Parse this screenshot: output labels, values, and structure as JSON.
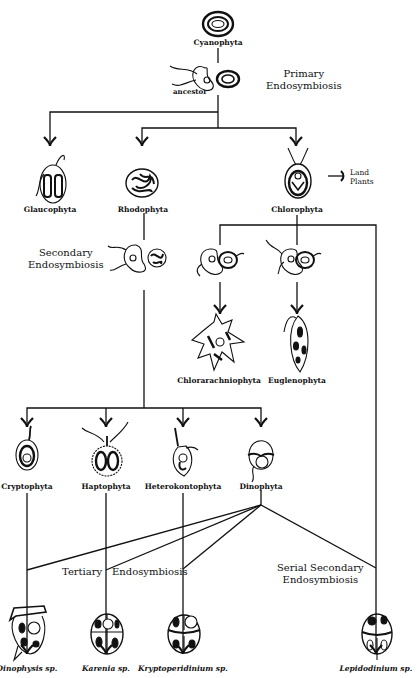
{
  "diagram": {
    "type": "phylogenetic-tree",
    "topic": "Endosymbiotic origins of plastids"
  },
  "nodes": {
    "cyanophyta": "Cyanophyta",
    "ancestor": "ancestor",
    "glaucophyta": "Glaucophyta",
    "rhodophyta": "Rhodophyta",
    "chlorophyta": "Chlorophyta",
    "land_plants": "Land Plants",
    "chlorarachniophyta": "Chlorarachniophyta",
    "euglenophyta": "Euglenophyta",
    "cryptophyta": "Cryptophyta",
    "haptophyta": "Haptophyta",
    "heterokontophyta": "Heterokontophyta",
    "dinophyta": "Dinophyta",
    "dinophysis": "Dinophysis sp.",
    "karenia": "Karenia sp.",
    "kryptoperidinium": "Kryptoperidinium sp.",
    "lepidodinium": "Lepidodinium sp."
  },
  "events": {
    "primary_1": "Primary",
    "primary_2": "Endosymbiosis",
    "secondary_1": "Secondary",
    "secondary_2": "Endosymbiosis",
    "tertiary_1": "Tertiary",
    "tertiary_2": "Endosymbiosis",
    "serial_1": "Serial Secondary",
    "serial_2": "Endosymbiosis"
  },
  "land_plants": {
    "line1": "Land",
    "line2": "Plants"
  },
  "edges": [
    [
      "Cyanophyta",
      "ancestor"
    ],
    [
      "ancestor",
      "Glaucophyta"
    ],
    [
      "ancestor",
      "Rhodophyta"
    ],
    [
      "ancestor",
      "Chlorophyta"
    ],
    [
      "Chlorophyta",
      "Land Plants"
    ],
    [
      "Chlorophyta",
      "Chlorarachniophyta"
    ],
    [
      "Chlorophyta",
      "Euglenophyta"
    ],
    [
      "Chlorophyta",
      "Lepidodinium sp."
    ],
    [
      "Rhodophyta",
      "Cryptophyta"
    ],
    [
      "Rhodophyta",
      "Haptophyta"
    ],
    [
      "Rhodophyta",
      "Heterokontophyta"
    ],
    [
      "Rhodophyta",
      "Dinophyta"
    ],
    [
      "Cryptophyta",
      "Dinophysis sp."
    ],
    [
      "Haptophyta",
      "Karenia sp."
    ],
    [
      "Heterokontophyta",
      "Kryptoperidinium sp."
    ],
    [
      "Dinophyta",
      "Dinophysis sp."
    ],
    [
      "Dinophyta",
      "Karenia sp."
    ],
    [
      "Dinophyta",
      "Kryptoperidinium sp."
    ],
    [
      "Dinophyta",
      "Lepidodinium sp."
    ]
  ]
}
